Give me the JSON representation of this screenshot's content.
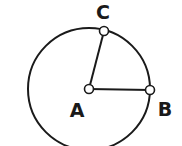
{
  "diagram": {
    "type": "circle-geometry",
    "stroke_color": "#1a1a1a",
    "background": "#ffffff",
    "circle": {
      "center": "A",
      "cx": 89,
      "cy": 89,
      "r": 61
    },
    "points": [
      {
        "id": "A",
        "label": "A",
        "x": 89,
        "y": 89,
        "label_x": 77,
        "label_y": 117
      },
      {
        "id": "B",
        "label": "B",
        "x": 150,
        "y": 90,
        "label_x": 165,
        "label_y": 116
      },
      {
        "id": "C",
        "label": "C",
        "x": 104,
        "y": 31,
        "label_x": 103,
        "label_y": 19
      }
    ],
    "segments": [
      {
        "from": "A",
        "to": "C",
        "name": "radius-AC"
      },
      {
        "from": "A",
        "to": "B",
        "name": "radius-AB"
      }
    ]
  }
}
